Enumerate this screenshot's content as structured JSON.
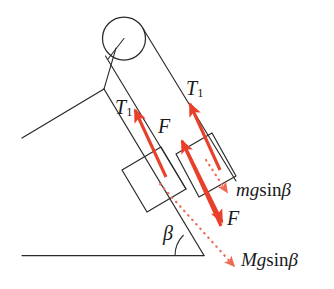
{
  "figure": {
    "colors": {
      "line": "#2b2b2b",
      "force_red": "#e8402a",
      "dotted_red": "#ef6a55",
      "background": "#ffffff",
      "text": "#1a1a1a"
    },
    "labels": [
      {
        "id": "tension-left",
        "text_main": "T",
        "text_sub": "1",
        "full": "T1"
      },
      {
        "id": "tension-right",
        "text_main": "T",
        "text_sub": "1",
        "full": "T1"
      },
      {
        "id": "force-upper",
        "text_main": "F",
        "text_sub": "",
        "full": "F"
      },
      {
        "id": "force-lower",
        "text_main": "F",
        "text_sub": "",
        "full": "F"
      },
      {
        "id": "angle-beta",
        "text_main": "β",
        "text_sub": "",
        "full": "β"
      },
      {
        "id": "weight-small",
        "text_main": "mg",
        "text_sub": "",
        "full": "mg sinβ"
      },
      {
        "id": "weight-large",
        "text_main": "Mg",
        "text_sub": "",
        "full": "Mg sinβ"
      }
    ],
    "label_text": {
      "t1_main": "T",
      "t1_sub": "1",
      "f": "F",
      "beta": "β",
      "mg_italic": "mg",
      "mg_sin": "sin",
      "mg_beta": "β",
      "Mg_italic": "Mg",
      "Mg_sin": "sin",
      "Mg_beta": "β"
    },
    "elements": {
      "pulley": "pulley-circle",
      "ground": "ground-line",
      "incline": "incline-line",
      "left_slope": "left-slope-line",
      "block_upper": "block-upper",
      "block_lower": "block-lower",
      "rope_left": "rope-left",
      "rope_right": "rope-right",
      "angle_arc": "angle-arc-beta"
    },
    "arrows": {
      "tension_left": "arrow-tension-left",
      "tension_right": "arrow-tension-right",
      "force_up": "arrow-force-up",
      "force_down": "arrow-force-down",
      "mg_sin_beta": "arrow-mg-sin-beta-dotted",
      "Mg_sin_beta": "arrow-Mg-sin-beta-dotted"
    }
  }
}
